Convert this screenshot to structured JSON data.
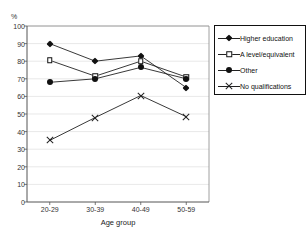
{
  "chart_data": {
    "type": "line",
    "title": "",
    "xlabel": "Age group",
    "ylabel": "%",
    "categories": [
      "20-29",
      "30-39",
      "40-49",
      "50-59"
    ],
    "ylim": [
      0,
      100
    ],
    "yticks": [
      0,
      10,
      20,
      30,
      40,
      50,
      60,
      70,
      80,
      90,
      100
    ],
    "grid": true,
    "legend_position": "right",
    "series": [
      {
        "name": "Higher education",
        "marker": "filled-diamond",
        "values": [
          90,
          80,
          83,
          65
        ]
      },
      {
        "name": "A level/equivalent",
        "marker": "open-square",
        "values": [
          80.5,
          71.5,
          80,
          71
        ]
      },
      {
        "name": "Other",
        "marker": "filled-circle",
        "values": [
          68,
          70,
          76.5,
          70
        ]
      },
      {
        "name": "No qualifications",
        "marker": "cross",
        "values": [
          35,
          48,
          60.5,
          48.5
        ]
      }
    ]
  },
  "axis": {
    "y_unit_label": "%",
    "x_title": "Age group",
    "y_tick_labels": [
      "100",
      "90",
      "80",
      "70",
      "60",
      "50",
      "40",
      "30",
      "20",
      "10",
      "0"
    ],
    "x_tick_labels": [
      "20-29",
      "30-39",
      "40-49",
      "50-59"
    ]
  },
  "legend": {
    "items": [
      {
        "label": "Higher education",
        "marker": "filled-diamond"
      },
      {
        "label": "A level/equivalent",
        "marker": "open-square"
      },
      {
        "label": "Other",
        "marker": "filled-circle"
      },
      {
        "label": "No qualifications",
        "marker": "cross"
      }
    ]
  },
  "colors": {
    "line": "#222222",
    "marker_fill": "#111111",
    "axis": "#555555",
    "grid": "#d9d9d9",
    "background": "#ffffff"
  }
}
